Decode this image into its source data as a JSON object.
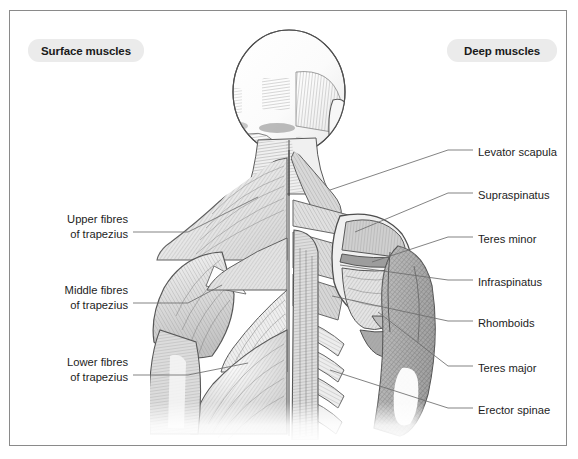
{
  "panel": {
    "background_color": "#ffffff",
    "border_color": "#8a8a8a"
  },
  "headers": {
    "surface": "Surface muscles",
    "deep": "Deep muscles",
    "pill_background": "#ebebeb",
    "pill_text_color": "#1a1a1a"
  },
  "illustration": {
    "name": "posterior-back-muscles",
    "description": "Grayscale anatomical illustration of the human upper back and shoulders viewed from behind, split down the midline: superficial muscle layer on the left side, deep muscle layer on the right side.",
    "style": "pen-and-ink hatched medical illustration",
    "line_color": "#4a4a4a",
    "fill_light": "#f2f2f2",
    "fill_mid": "#cfcfcf",
    "fill_dark": "#9a9a9a"
  },
  "labels_left": [
    {
      "id": "upper-fibres-trapezius",
      "line1": "Upper fibres",
      "line2": "of trapezius",
      "text_x": 128,
      "text_y": 226,
      "leader": "M133,232 L188,232 L258,197"
    },
    {
      "id": "middle-fibres-trapezius",
      "line1": "Middle fibres",
      "line2": "of trapezius",
      "text_x": 128,
      "text_y": 297,
      "leader": "M133,303 L188,303 L222,285"
    },
    {
      "id": "lower-fibres-trapezius",
      "line1": "Lower fibres",
      "line2": "of trapezius",
      "text_x": 128,
      "text_y": 369,
      "leader": "M133,375 L188,375 L248,363"
    }
  ],
  "labels_right": [
    {
      "id": "levator-scapula",
      "line1": "Levator scapula",
      "line2": "",
      "text_x": 478,
      "text_y": 152,
      "leader": "M473,150 L448,150 L330,190"
    },
    {
      "id": "supraspinatus",
      "line1": "Supraspinatus",
      "line2": "",
      "text_x": 478,
      "text_y": 195,
      "leader": "M473,193 L448,193 L355,232"
    },
    {
      "id": "teres-minor",
      "line1": "Teres minor",
      "line2": "",
      "text_x": 478,
      "text_y": 239,
      "leader": "M473,237 L448,237 L372,262"
    },
    {
      "id": "infraspinatus",
      "line1": "Infraspinatus",
      "line2": "",
      "text_x": 478,
      "text_y": 282,
      "leader": "M473,280 L448,280 L340,265"
    },
    {
      "id": "rhomboids",
      "line1": "Rhomboids",
      "line2": "",
      "text_x": 478,
      "text_y": 323,
      "leader": "M473,321 L448,321 L332,296"
    },
    {
      "id": "teres-major",
      "line1": "Teres major",
      "line2": "",
      "text_x": 478,
      "text_y": 368,
      "leader": "M473,366 L448,366 L378,312"
    },
    {
      "id": "erector-spinae",
      "line1": "Erector spinae",
      "line2": "",
      "text_x": 478,
      "text_y": 410,
      "leader": "M473,408 L448,408 L330,370"
    }
  ]
}
